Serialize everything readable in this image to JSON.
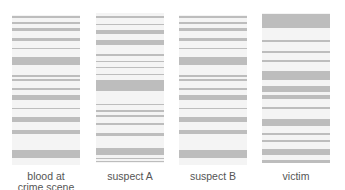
{
  "figure": {
    "band_color": "#bdbdbd",
    "lane_background": "#f4f4f4",
    "label_color": "#555555"
  },
  "lanes": [
    {
      "label": "blood at crime scene",
      "label_lines": [
        "blood at",
        "crime scene"
      ],
      "bands": [
        [
          0.007,
          0.02
        ],
        [
          0.047,
          0.06
        ],
        [
          0.087,
          0.107
        ],
        [
          0.153,
          0.173
        ],
        [
          0.22,
          0.227
        ],
        [
          0.28,
          0.333
        ],
        [
          0.4,
          0.413
        ],
        [
          0.427,
          0.44
        ],
        [
          0.487,
          0.5
        ],
        [
          0.533,
          0.567
        ],
        [
          0.62,
          0.627
        ],
        [
          0.68,
          0.713
        ],
        [
          0.767,
          0.793
        ],
        [
          0.9,
          0.953
        ]
      ]
    },
    {
      "label": "suspect A",
      "label_lines": [
        "suspect A"
      ],
      "bands": [
        [
          0.02,
          0.033
        ],
        [
          0.073,
          0.08
        ],
        [
          0.113,
          0.14
        ],
        [
          0.18,
          0.213
        ],
        [
          0.273,
          0.287
        ],
        [
          0.32,
          0.327
        ],
        [
          0.36,
          0.367
        ],
        [
          0.407,
          0.413
        ],
        [
          0.447,
          0.52
        ],
        [
          0.607,
          0.613
        ],
        [
          0.647,
          0.66
        ],
        [
          0.68,
          0.693
        ],
        [
          0.733,
          0.747
        ],
        [
          0.8,
          0.82
        ],
        [
          0.9,
          0.947
        ],
        [
          0.967,
          0.973
        ],
        [
          0.987,
          0.993
        ]
      ]
    },
    {
      "label": "suspect B",
      "label_lines": [
        "suspect B"
      ],
      "bands": [
        [
          0.007,
          0.02
        ],
        [
          0.047,
          0.06
        ],
        [
          0.087,
          0.107
        ],
        [
          0.153,
          0.173
        ],
        [
          0.22,
          0.227
        ],
        [
          0.28,
          0.333
        ],
        [
          0.4,
          0.413
        ],
        [
          0.427,
          0.44
        ],
        [
          0.487,
          0.5
        ],
        [
          0.533,
          0.567
        ],
        [
          0.62,
          0.627
        ],
        [
          0.68,
          0.713
        ],
        [
          0.767,
          0.793
        ],
        [
          0.9,
          0.953
        ]
      ]
    },
    {
      "label": "victim",
      "label_lines": [
        "victim"
      ],
      "bands": [
        [
          0.007,
          0.1
        ],
        [
          0.18,
          0.193
        ],
        [
          0.253,
          0.267
        ],
        [
          0.313,
          0.327
        ],
        [
          0.387,
          0.447
        ],
        [
          0.487,
          0.527
        ],
        [
          0.547,
          0.573
        ],
        [
          0.627,
          0.64
        ],
        [
          0.707,
          0.753
        ],
        [
          0.8,
          0.813
        ],
        [
          0.847,
          0.86
        ],
        [
          0.907,
          0.947
        ],
        [
          0.98,
          1.0
        ]
      ]
    }
  ]
}
